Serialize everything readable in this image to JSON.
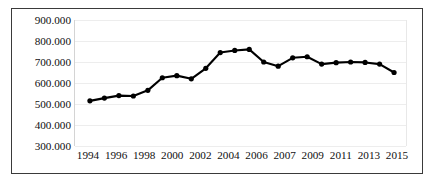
{
  "chart_data": {
    "type": "line",
    "title": "",
    "subtitle": "",
    "xlabel": "",
    "ylabel": "",
    "grid": true,
    "legend": false,
    "legend_position": "none",
    "line_color": "#000000",
    "marker": "circle",
    "marker_color": "#000000",
    "ylim": [
      300000,
      900000
    ],
    "y_tick_labels": [
      "900.000",
      "800.000",
      "700.000",
      "600.000",
      "500.000",
      "400.000",
      "300.000"
    ],
    "y_tick_values": [
      900000,
      800000,
      700000,
      600000,
      500000,
      400000,
      300000
    ],
    "x_tick_labels": [
      "1994",
      "1996",
      "1998",
      "2000",
      "2002",
      "2004",
      "2006",
      "2007",
      "2009",
      "2011",
      "2013",
      "2015"
    ],
    "x": [
      1995,
      1996,
      1997,
      1998,
      1999,
      2000,
      2001,
      2002,
      2003,
      2004,
      2005,
      2006,
      2007,
      2008,
      2009,
      2010,
      2011,
      2012,
      2013,
      2014,
      2015,
      2016
    ],
    "categories": [
      "1995",
      "1996",
      "1997",
      "1998",
      "1999",
      "2000",
      "2001",
      "2002",
      "2003",
      "2004",
      "2005",
      "2006",
      "2007",
      "2008",
      "2009",
      "2010",
      "2011",
      "2012",
      "2013",
      "2014",
      "2015",
      "2016"
    ],
    "values": [
      515000,
      528000,
      540000,
      538000,
      565000,
      625000,
      635000,
      620000,
      670000,
      745000,
      755000,
      760000,
      700000,
      680000,
      720000,
      725000,
      690000,
      697000,
      700000,
      698000,
      690000,
      650000
    ]
  },
  "figure": {
    "border_color": "#3a3a3a",
    "background": "#ffffff",
    "gridline_color": "#ededed"
  }
}
